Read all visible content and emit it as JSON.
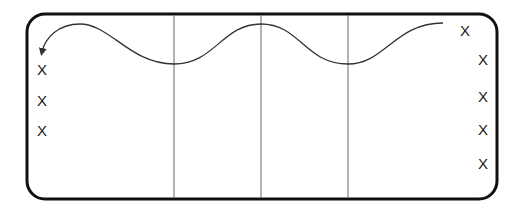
{
  "diagram": {
    "title": "",
    "court": {
      "stroke": "#111111",
      "x": 27,
      "y": 14,
      "width": 470,
      "height": 185,
      "radius": 18
    },
    "divider_lines": [
      {
        "x": 174
      },
      {
        "x": 261
      },
      {
        "x": 348
      }
    ],
    "path": {
      "description": "wavy path with arrow pointing down-left",
      "stroke": "#333333",
      "d": "M 443 23 C 395 23, 385 64, 348 64 C 305 64, 300 24, 261 24 C 222 24, 215 64, 174 64 C 130 64, 110 24, 80 24 C 58 24, 45 38, 42 52"
    },
    "markers_left": [
      {
        "label": "X",
        "x": 42,
        "y": 70
      },
      {
        "label": "X",
        "x": 42,
        "y": 101
      },
      {
        "label": "X",
        "x": 42,
        "y": 131
      }
    ],
    "markers_right": [
      {
        "label": "X",
        "x": 465,
        "y": 31
      },
      {
        "label": "X",
        "x": 483,
        "y": 60
      },
      {
        "label": "X",
        "x": 483,
        "y": 97
      },
      {
        "label": "X",
        "x": 483,
        "y": 130
      },
      {
        "label": "X",
        "x": 483,
        "y": 164
      }
    ]
  }
}
